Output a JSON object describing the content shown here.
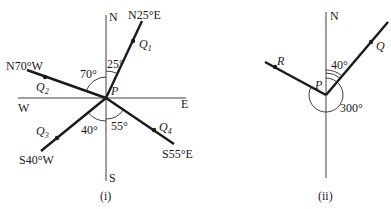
{
  "figure_i": {
    "caption": "(i)",
    "compass": {
      "north": "N",
      "south": "S",
      "east": "E",
      "west": "W"
    },
    "center_label": "P",
    "bearings": [
      {
        "label": "N25°E",
        "point": "Q",
        "sub": "1",
        "angle_label": "25°"
      },
      {
        "label": "N70°W",
        "point": "Q",
        "sub": "2",
        "angle_label": "70°"
      },
      {
        "label": "S40°W",
        "point": "Q",
        "sub": "3",
        "angle_label": "40°"
      },
      {
        "label": "S55°E",
        "point": "Q",
        "sub": "4",
        "angle_label": "55°"
      }
    ]
  },
  "figure_ii": {
    "caption": "(ii)",
    "north": "N",
    "center_label": "P",
    "point_q": "Q",
    "point_r": "R",
    "angle_q": "40°",
    "angle_r": "300°"
  }
}
